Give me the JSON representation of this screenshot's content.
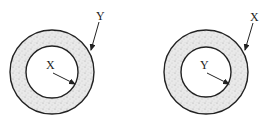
{
  "diagram": {
    "type": "two concentric-ring cross sections",
    "colors": {
      "stroke": "#222222",
      "ring_fill": "#e6e6e6",
      "core_fill": "#ffffff",
      "background": "#ffffff"
    },
    "figures": [
      {
        "id": "left",
        "center": [
          52,
          72
        ],
        "outer_radius": 42,
        "inner_radius": 26,
        "inner_label": "X",
        "outer_label": "Y"
      },
      {
        "id": "right",
        "center": [
          206,
          72
        ],
        "outer_radius": 42,
        "inner_radius": 25,
        "inner_label": "Y",
        "outer_label": "X"
      }
    ]
  }
}
